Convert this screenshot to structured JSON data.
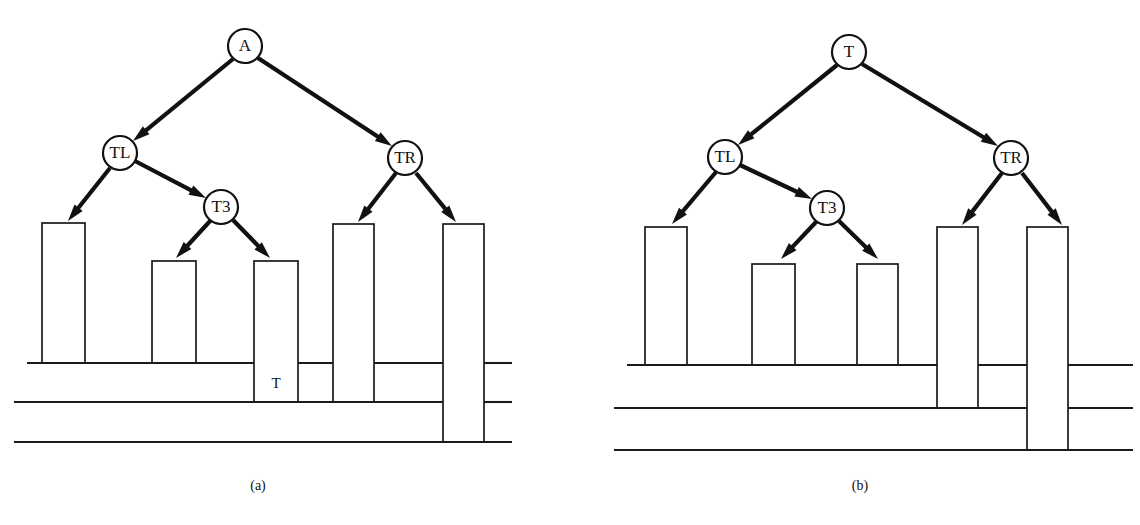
{
  "figure": {
    "width": 1140,
    "height": 525,
    "background_color": "#ffffff",
    "line_color": "#1a1a1a",
    "node_fill_color": "#ffffff",
    "edge_color": "#111111"
  },
  "panels": [
    {
      "id": "panel-a",
      "caption": "(a)",
      "caption_x": 258,
      "caption_y": 487,
      "tree": {
        "nodes": [
          {
            "id": "root",
            "label": "A",
            "cx": 245,
            "cy": 46,
            "r": 17
          },
          {
            "id": "tl",
            "label": "TL",
            "cx": 120,
            "cy": 153,
            "r": 17
          },
          {
            "id": "t3",
            "label": "T3",
            "cx": 221,
            "cy": 207,
            "r": 17
          },
          {
            "id": "tr",
            "label": "TR",
            "cx": 405,
            "cy": 158,
            "r": 17
          }
        ],
        "edges": [
          {
            "from": "root",
            "to": "tl",
            "x1": 233,
            "y1": 59,
            "x2": 133,
            "y2": 141
          },
          {
            "from": "root",
            "to": "tr",
            "x1": 258,
            "y1": 58,
            "x2": 392,
            "y2": 146
          },
          {
            "from": "tl",
            "to": "bar1",
            "x1": 110,
            "y1": 168,
            "x2": 68,
            "y2": 221
          },
          {
            "from": "tl",
            "to": "t3",
            "x1": 135,
            "y1": 161,
            "x2": 206,
            "y2": 198
          },
          {
            "from": "t3",
            "to": "bar2",
            "x1": 211,
            "y1": 220,
            "x2": 176,
            "y2": 258
          },
          {
            "from": "t3",
            "to": "bar3",
            "x1": 233,
            "y1": 220,
            "x2": 270,
            "y2": 258
          },
          {
            "from": "tr",
            "to": "bar4",
            "x1": 396,
            "y1": 173,
            "x2": 358,
            "y2": 222
          },
          {
            "from": "tr",
            "to": "bar5",
            "x1": 416,
            "y1": 173,
            "x2": 456,
            "y2": 222
          }
        ]
      },
      "base_lines": [
        {
          "id": "line-1",
          "x1": 27,
          "x2": 512,
          "y": 363
        },
        {
          "id": "line-2",
          "x1": 14,
          "x2": 512,
          "y": 402
        },
        {
          "id": "line-3",
          "x1": 14,
          "x2": 512,
          "y": 442
        }
      ],
      "bars": [
        {
          "id": "bar-1",
          "x": 42,
          "width": 43,
          "top": 223,
          "bottom": 363,
          "inner_label": ""
        },
        {
          "id": "bar-2",
          "x": 152,
          "width": 44,
          "top": 261,
          "bottom": 363,
          "inner_label": ""
        },
        {
          "id": "bar-3",
          "x": 254,
          "width": 44,
          "top": 261,
          "bottom": 402,
          "inner_label": "T"
        },
        {
          "id": "bar-4",
          "x": 333,
          "width": 41,
          "top": 224,
          "bottom": 402,
          "inner_label": ""
        },
        {
          "id": "bar-5",
          "x": 443,
          "width": 41,
          "top": 224,
          "bottom": 442,
          "inner_label": ""
        }
      ],
      "bar_inner_labels": [
        {
          "id": "bar-3-label",
          "text": "T",
          "x": 276,
          "y": 385
        }
      ]
    },
    {
      "id": "panel-b",
      "caption": "(b)",
      "caption_x": 860,
      "caption_y": 487,
      "tree": {
        "nodes": [
          {
            "id": "root",
            "label": "T",
            "cx": 849,
            "cy": 52,
            "r": 17
          },
          {
            "id": "tl",
            "label": "TL",
            "cx": 725,
            "cy": 157,
            "r": 17
          },
          {
            "id": "t3",
            "label": "T3",
            "cx": 827,
            "cy": 208,
            "r": 17
          },
          {
            "id": "tr",
            "label": "TR",
            "cx": 1011,
            "cy": 158,
            "r": 17
          }
        ],
        "edges": [
          {
            "from": "root",
            "to": "tl",
            "x1": 837,
            "y1": 65,
            "x2": 738,
            "y2": 145
          },
          {
            "from": "root",
            "to": "tr",
            "x1": 862,
            "y1": 64,
            "x2": 998,
            "y2": 146
          },
          {
            "from": "tl",
            "to": "bar1",
            "x1": 716,
            "y1": 172,
            "x2": 672,
            "y2": 224
          },
          {
            "from": "tl",
            "to": "t3",
            "x1": 740,
            "y1": 165,
            "x2": 812,
            "y2": 199
          },
          {
            "from": "t3",
            "to": "bar2",
            "x1": 817,
            "y1": 221,
            "x2": 781,
            "y2": 259
          },
          {
            "from": "t3",
            "to": "bar3",
            "x1": 839,
            "y1": 221,
            "x2": 878,
            "y2": 259
          },
          {
            "from": "tr",
            "to": "bar4",
            "x1": 1002,
            "y1": 173,
            "x2": 962,
            "y2": 225
          },
          {
            "from": "tr",
            "to": "bar5",
            "x1": 1022,
            "y1": 173,
            "x2": 1062,
            "y2": 225
          }
        ]
      },
      "base_lines": [
        {
          "id": "line-1",
          "x1": 627,
          "x2": 1133,
          "y": 365
        },
        {
          "id": "line-2",
          "x1": 614,
          "x2": 1133,
          "y": 408
        },
        {
          "id": "line-3",
          "x1": 614,
          "x2": 1133,
          "y": 450
        }
      ],
      "bars": [
        {
          "id": "bar-1",
          "x": 645,
          "width": 42,
          "top": 227,
          "bottom": 365,
          "inner_label": ""
        },
        {
          "id": "bar-2",
          "x": 752,
          "width": 43,
          "top": 264,
          "bottom": 365,
          "inner_label": ""
        },
        {
          "id": "bar-3",
          "x": 857,
          "width": 41,
          "top": 264,
          "bottom": 365,
          "inner_label": ""
        },
        {
          "id": "bar-4",
          "x": 937,
          "width": 41,
          "top": 227,
          "bottom": 408,
          "inner_label": ""
        },
        {
          "id": "bar-5",
          "x": 1027,
          "width": 41,
          "top": 227,
          "bottom": 450,
          "inner_label": ""
        }
      ],
      "bar_inner_labels": []
    }
  ]
}
